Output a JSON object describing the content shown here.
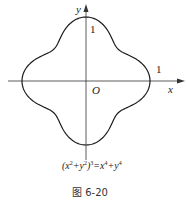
{
  "figure": {
    "axis_labels": {
      "x": "x",
      "y": "y",
      "origin": "O"
    },
    "ticks": {
      "x_intercept": "1",
      "y_intercept": "1"
    },
    "equation": {
      "lhs_open": "(x",
      "lhs_sq1": "2",
      "lhs_plus": "+y",
      "lhs_sq2": "2",
      "lhs_close": ")",
      "lhs_cube": "3",
      "equals": "=x",
      "rhs_pow1": "4",
      "rhs_plus": "+y",
      "rhs_pow2": "4"
    },
    "caption": "图 6-20",
    "curve": {
      "polar_form": "r^2 = cos^4(t) + sin^4(t)",
      "color": "#1a1a1a",
      "center_px": [
        86,
        81
      ],
      "unit_px": 64
    },
    "axis_color": "#333333"
  }
}
